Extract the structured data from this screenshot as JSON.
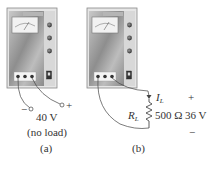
{
  "figure": {
    "panel_a": {
      "caption": "(a)",
      "voltage_label": "40 V",
      "condition_label": "(no load)",
      "minus_terminal": "−",
      "plus_terminal": "+",
      "supply_label": "Power supply"
    },
    "panel_b": {
      "caption": "(b)",
      "current_label": "I",
      "current_sub": "L",
      "resistor_label": "R",
      "resistor_sub": "L",
      "resistance_value": "500 Ω",
      "voltage_label": "36 V",
      "plus_terminal": "+",
      "minus_terminal": "−",
      "supply_label": "Power supply"
    }
  }
}
